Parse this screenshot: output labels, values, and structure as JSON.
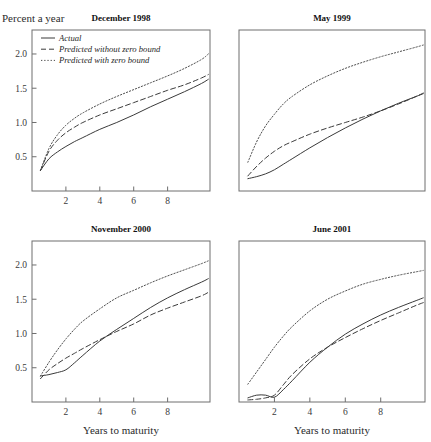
{
  "figure": {
    "ylabel": "Percent a year",
    "xlabel": "Years to maturity",
    "legend": [
      {
        "key": "actual",
        "label": "Actual",
        "style": "solid"
      },
      {
        "key": "pred_no_zb",
        "label": "Predicted without zero bound",
        "style": "dashed"
      },
      {
        "key": "pred_zb",
        "label": "Predicted with zero bound",
        "style": "dotted"
      }
    ],
    "colors": {
      "line": "#3a3a3a",
      "frame": "#6e6e6e",
      "text": "#1a1a1a"
    }
  },
  "chart_data": [
    {
      "type": "line",
      "title": "December 1998",
      "panel": "top-left",
      "xlabel": "",
      "ylabel": "Percent a year",
      "xlim": [
        0,
        10.5
      ],
      "ylim": [
        0.0,
        2.35
      ],
      "xticks": [
        2,
        4,
        6,
        8
      ],
      "yticks": [
        0.5,
        1.0,
        1.5,
        2.0
      ],
      "grid": false,
      "legend_position": "top-left",
      "x": [
        0.5,
        1,
        1.5,
        2,
        2.5,
        3,
        4,
        5,
        6,
        7,
        8,
        9,
        10,
        10.4
      ],
      "series": [
        {
          "name": "Actual",
          "style": "solid",
          "values": [
            0.3,
            0.47,
            0.57,
            0.65,
            0.72,
            0.78,
            0.9,
            1.0,
            1.11,
            1.23,
            1.34,
            1.45,
            1.57,
            1.63
          ]
        },
        {
          "name": "Predicted without zero bound",
          "style": "dashed",
          "values": [
            0.3,
            0.58,
            0.74,
            0.85,
            0.93,
            1.0,
            1.11,
            1.2,
            1.29,
            1.38,
            1.47,
            1.55,
            1.65,
            1.7
          ]
        },
        {
          "name": "Predicted with zero bound",
          "style": "dotted",
          "values": [
            0.3,
            0.62,
            0.82,
            0.96,
            1.06,
            1.14,
            1.27,
            1.38,
            1.48,
            1.58,
            1.68,
            1.79,
            1.92,
            2.0
          ]
        }
      ]
    },
    {
      "type": "line",
      "title": "May 1999",
      "panel": "top-right",
      "xlabel": "",
      "ylabel": "",
      "xlim": [
        0,
        10.5
      ],
      "ylim": [
        0.0,
        2.35
      ],
      "xticks": [],
      "yticks": [],
      "grid": false,
      "legend_position": "none",
      "x": [
        0.5,
        1,
        1.5,
        2,
        2.5,
        3,
        4,
        5,
        6,
        7,
        8,
        9,
        10,
        10.4
      ],
      "series": [
        {
          "name": "Actual",
          "style": "solid",
          "values": [
            0.18,
            0.21,
            0.25,
            0.31,
            0.39,
            0.47,
            0.63,
            0.78,
            0.92,
            1.05,
            1.17,
            1.28,
            1.38,
            1.42
          ]
        },
        {
          "name": "Predicted without zero bound",
          "style": "dashed",
          "values": [
            0.22,
            0.36,
            0.48,
            0.58,
            0.66,
            0.72,
            0.83,
            0.92,
            1.0,
            1.08,
            1.17,
            1.27,
            1.38,
            1.43
          ]
        },
        {
          "name": "Predicted with zero bound",
          "style": "dotted",
          "values": [
            0.42,
            0.72,
            0.95,
            1.12,
            1.27,
            1.38,
            1.55,
            1.68,
            1.79,
            1.88,
            1.96,
            2.03,
            2.1,
            2.13
          ]
        }
      ]
    },
    {
      "type": "line",
      "title": "November 2000",
      "panel": "bottom-left",
      "xlabel": "Years to maturity",
      "ylabel": "",
      "xlim": [
        0,
        10.5
      ],
      "ylim": [
        0.0,
        2.35
      ],
      "xticks": [
        2,
        4,
        6,
        8
      ],
      "yticks": [
        0.5,
        1.0,
        1.5,
        2.0
      ],
      "grid": false,
      "legend_position": "none",
      "x": [
        0.5,
        1,
        1.5,
        2,
        2.5,
        3,
        4,
        5,
        6,
        7,
        8,
        9,
        10,
        10.4
      ],
      "series": [
        {
          "name": "Actual",
          "style": "solid",
          "values": [
            0.38,
            0.4,
            0.43,
            0.47,
            0.57,
            0.68,
            0.89,
            1.06,
            1.22,
            1.38,
            1.52,
            1.64,
            1.75,
            1.8
          ]
        },
        {
          "name": "Predicted without zero bound",
          "style": "dashed",
          "values": [
            0.34,
            0.47,
            0.56,
            0.64,
            0.71,
            0.78,
            0.91,
            1.03,
            1.14,
            1.27,
            1.37,
            1.46,
            1.55,
            1.6
          ]
        },
        {
          "name": "Predicted with zero bound",
          "style": "dotted",
          "values": [
            0.38,
            0.58,
            0.76,
            0.92,
            1.06,
            1.18,
            1.36,
            1.52,
            1.63,
            1.74,
            1.84,
            1.93,
            2.02,
            2.06
          ]
        }
      ]
    },
    {
      "type": "line",
      "title": "June 2001",
      "panel": "bottom-right",
      "xlabel": "Years to maturity",
      "ylabel": "",
      "xlim": [
        0,
        10.5
      ],
      "ylim": [
        0.0,
        2.35
      ],
      "xticks": [
        2,
        4,
        6,
        8
      ],
      "yticks": [],
      "grid": false,
      "legend_position": "none",
      "x": [
        0.5,
        1,
        1.5,
        2,
        2.5,
        3,
        4,
        5,
        6,
        7,
        8,
        9,
        10,
        10.4
      ],
      "series": [
        {
          "name": "Actual",
          "style": "solid",
          "values": [
            0.06,
            0.1,
            0.1,
            0.07,
            0.18,
            0.31,
            0.58,
            0.8,
            0.99,
            1.14,
            1.27,
            1.38,
            1.48,
            1.52
          ]
        },
        {
          "name": "Predicted without zero bound",
          "style": "dashed",
          "values": [
            0.03,
            0.04,
            0.06,
            0.1,
            0.25,
            0.4,
            0.63,
            0.8,
            0.94,
            1.07,
            1.19,
            1.3,
            1.41,
            1.45
          ]
        },
        {
          "name": "Predicted with zero bound",
          "style": "dotted",
          "values": [
            0.26,
            0.44,
            0.62,
            0.8,
            0.96,
            1.1,
            1.33,
            1.5,
            1.62,
            1.72,
            1.79,
            1.85,
            1.9,
            1.92
          ]
        }
      ]
    }
  ]
}
